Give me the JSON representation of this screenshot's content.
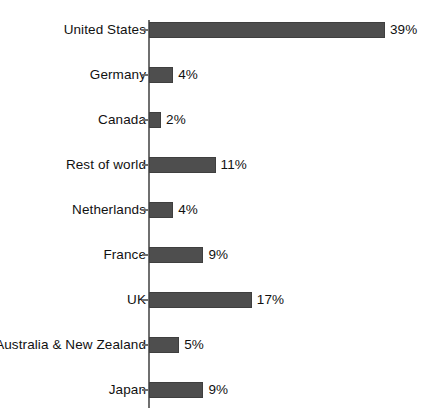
{
  "chart_data": {
    "type": "bar",
    "orientation": "horizontal",
    "title": "",
    "subtitle": "",
    "xlabel": "",
    "ylabel": "",
    "xlim": [
      0,
      40
    ],
    "grid": false,
    "legend": null,
    "value_suffix": "%",
    "categories": [
      "United States",
      "Germany",
      "Canada",
      "Rest of world",
      "Netherlands",
      "France",
      "UK",
      "Australia & New Zealand",
      "Japan"
    ],
    "values": [
      39,
      4,
      2,
      11,
      4,
      9,
      17,
      5,
      9
    ],
    "data_labels": [
      "39%",
      "4%",
      "2%",
      "11%",
      "4%",
      "9%",
      "17%",
      "5%",
      "9%"
    ],
    "colors": {
      "bar_fill": "#4e4e4e",
      "bar_stroke": "#3f3f3f",
      "axis": "#6f6f6f",
      "text": "#111111",
      "background": "#ffffff"
    }
  }
}
